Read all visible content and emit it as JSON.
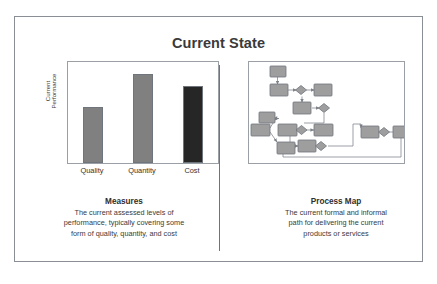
{
  "slide": {
    "title": "Current State",
    "background_color": "#ffffff",
    "frame_border_color": "#8a8f96",
    "divider_color": "#6f757c"
  },
  "left_panel": {
    "caption_title": "Measures",
    "caption_lines": [
      "The current assessed levels of",
      "performance, typically covering some",
      "form of quality, quantity, and cost"
    ]
  },
  "right_panel": {
    "caption_title": "Process Map",
    "caption_lines": [
      "The current formal and informal",
      "path for delivering the current",
      "products or services"
    ]
  },
  "chart_data": {
    "type": "bar",
    "title": "",
    "categories": [
      "Quality",
      "Quantity",
      "Cost"
    ],
    "values": [
      55,
      88,
      76
    ],
    "ylim": [
      0,
      100
    ],
    "xlabel": "",
    "ylabel_lines": [
      "Current",
      "Performance"
    ],
    "grid": false,
    "legend": false,
    "bar_colors": [
      "#808080",
      "#808080",
      "#262626"
    ],
    "bar_border_color": "#6f757c",
    "plot_border_color": "#9aa0a6"
  },
  "process_map": {
    "node_fill": "#9e9e9e",
    "node_stroke": "#6f757c",
    "connector_color": "#8a8f96",
    "node_count": 13,
    "decision_count": 6
  }
}
